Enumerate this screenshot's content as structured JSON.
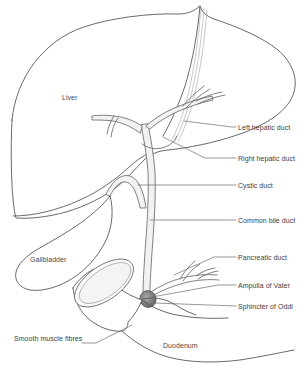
{
  "figure": {
    "background_color": "#ffffff",
    "outline_color": "#58585a",
    "duct_fill_color": "#f2f2f3",
    "sphincter_color": "#6e6e70",
    "text_color": "#3d3d3f"
  },
  "inner_labels": [
    {
      "id": "liver",
      "text": "Liver",
      "x": 62,
      "y": 100
    },
    {
      "id": "gallbladder",
      "text": "Gallbladder",
      "x": 30,
      "y": 262
    },
    {
      "id": "duodenum",
      "text": "Duodenum",
      "x": 163,
      "y": 348
    }
  ],
  "callout_labels": [
    {
      "id": "left-hepatic-duct",
      "text": "Left hepatic duct",
      "x": 238,
      "y": 130
    },
    {
      "id": "right-hepatic-duct",
      "text": "Right hepatic duct",
      "x": 238,
      "y": 161
    },
    {
      "id": "cystic-duct",
      "text": "Cystic duct",
      "x": 238,
      "y": 188
    },
    {
      "id": "common-bile-duct",
      "text": "Common bile duct",
      "x": 238,
      "y": 223
    },
    {
      "id": "pancreatic-duct",
      "text": "Pancreatic duct",
      "x": 238,
      "y": 260
    },
    {
      "id": "ampulla-of-vater",
      "text": "Ampulla of Vater",
      "x": 238,
      "y": 288
    },
    {
      "id": "sphincter-of-oddi",
      "text": "Sphincter of Oddi",
      "x": 238,
      "y": 309
    },
    {
      "id": "smooth-muscle-fibres",
      "text": "Smooth muscle fibres",
      "x": 14,
      "y": 341
    }
  ]
}
